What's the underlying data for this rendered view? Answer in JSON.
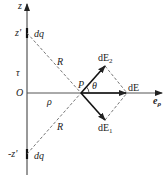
{
  "diagram": {
    "type": "physics-field-diagram",
    "axis_label": "z",
    "upper_source_position": "z'",
    "lower_source_position": "-z'",
    "charge_element_upper": "dq",
    "charge_element_lower": "dq",
    "line_charge_density": "τ",
    "origin": "O",
    "radial_distance": "ρ",
    "distance_upper": "R",
    "distance_lower": "R",
    "field_point": "P",
    "angle": "θ",
    "field_from_upper": "dE",
    "field_from_upper_sub": "2",
    "field_from_lower": "dE",
    "field_from_lower_sub": "1",
    "resultant_field": "dE",
    "unit_vector": "e",
    "unit_vector_sub": "ρ",
    "colors": {
      "line": "#222222",
      "dashed": "#555555",
      "background": "#ffffff"
    }
  }
}
